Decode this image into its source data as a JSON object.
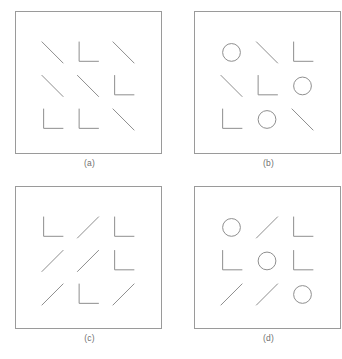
{
  "figure": {
    "width": 342,
    "height": 359,
    "background_color": "#ffffff",
    "stroke_color": "#8c8c8c",
    "border_color": "#9a9a9a",
    "label_color": "#6f6f6f",
    "bottom_caption": ""
  },
  "panels": [
    {
      "id": "panel-a",
      "label": "(a)",
      "grid_rows": 3,
      "grid_cols": 3,
      "items": [
        {
          "type": "diagonal-backslash",
          "name": "backslash-line"
        },
        {
          "type": "corner-L",
          "name": "l-shape"
        },
        {
          "type": "diagonal-backslash",
          "name": "backslash-line"
        },
        {
          "type": "diagonal-backslash",
          "name": "backslash-line"
        },
        {
          "type": "diagonal-backslash",
          "name": "backslash-line"
        },
        {
          "type": "corner-L",
          "name": "l-shape"
        },
        {
          "type": "corner-L",
          "name": "l-shape"
        },
        {
          "type": "corner-L",
          "name": "l-shape"
        },
        {
          "type": "diagonal-backslash",
          "name": "backslash-line"
        }
      ]
    },
    {
      "id": "panel-b",
      "label": "(b)",
      "grid_rows": 3,
      "grid_cols": 3,
      "items": [
        {
          "type": "circle",
          "name": "circle-shape"
        },
        {
          "type": "diagonal-backslash",
          "name": "backslash-line"
        },
        {
          "type": "corner-L",
          "name": "l-shape"
        },
        {
          "type": "diagonal-backslash",
          "name": "backslash-line"
        },
        {
          "type": "corner-L",
          "name": "l-shape"
        },
        {
          "type": "circle",
          "name": "circle-shape"
        },
        {
          "type": "corner-L",
          "name": "l-shape"
        },
        {
          "type": "circle",
          "name": "circle-shape"
        },
        {
          "type": "diagonal-backslash",
          "name": "backslash-line"
        }
      ]
    },
    {
      "id": "panel-c",
      "label": "(c)",
      "grid_rows": 3,
      "grid_cols": 3,
      "items": [
        {
          "type": "corner-L",
          "name": "l-shape"
        },
        {
          "type": "diagonal-slash",
          "name": "slash-line"
        },
        {
          "type": "corner-L",
          "name": "l-shape"
        },
        {
          "type": "diagonal-slash",
          "name": "slash-line"
        },
        {
          "type": "diagonal-slash",
          "name": "slash-line"
        },
        {
          "type": "corner-L",
          "name": "l-shape"
        },
        {
          "type": "diagonal-slash",
          "name": "slash-line"
        },
        {
          "type": "corner-L",
          "name": "l-shape"
        },
        {
          "type": "diagonal-slash",
          "name": "slash-line"
        }
      ]
    },
    {
      "id": "panel-d",
      "label": "(d)",
      "grid_rows": 3,
      "grid_cols": 3,
      "items": [
        {
          "type": "circle",
          "name": "circle-shape"
        },
        {
          "type": "diagonal-slash",
          "name": "slash-line"
        },
        {
          "type": "corner-L",
          "name": "l-shape"
        },
        {
          "type": "corner-L",
          "name": "l-shape"
        },
        {
          "type": "circle",
          "name": "circle-shape"
        },
        {
          "type": "corner-L",
          "name": "l-shape"
        },
        {
          "type": "diagonal-slash",
          "name": "slash-line"
        },
        {
          "type": "diagonal-slash",
          "name": "slash-line"
        },
        {
          "type": "circle",
          "name": "circle-shape"
        }
      ]
    }
  ]
}
